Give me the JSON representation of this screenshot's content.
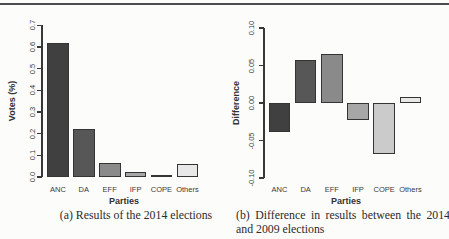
{
  "palette": {
    "bar_colors": [
      "#404040",
      "#575757",
      "#8a8a8a",
      "#a7a7a7",
      "#cbcbcb",
      "#e8e8e8"
    ],
    "bar_border": "#343434",
    "axis_color": "#383838",
    "text_color": "#3a3a3a",
    "rule_color": "#4c4c4c",
    "background": "#fcfcfb"
  },
  "captions": {
    "a": "(a) Results of the 2014 elections",
    "b": "(b) Difference in results between the 2014 and 2009 elections"
  },
  "chart_data": [
    {
      "type": "bar",
      "title": "",
      "categories": [
        "ANC",
        "DA",
        "EFF",
        "IFP",
        "COPE",
        "Others"
      ],
      "values": [
        0.62,
        0.22,
        0.065,
        0.024,
        0.007,
        0.062
      ],
      "xlabel": "Parties",
      "ylabel": "Votes (%)",
      "ylim": [
        0.0,
        0.7
      ],
      "yticks": [
        0.0,
        0.1,
        0.2,
        0.3,
        0.4,
        0.5,
        0.6,
        0.7
      ],
      "ytick_labels": [
        "0.0",
        "0.1",
        "0.2",
        "0.3",
        "0.4",
        "0.5",
        "0.6",
        "0.7"
      ],
      "grid": false,
      "legend": false
    },
    {
      "type": "bar",
      "title": "",
      "categories": [
        "ANC",
        "DA",
        "EFF",
        "IFP",
        "COPE",
        "Others"
      ],
      "values": [
        -0.038,
        0.057,
        0.065,
        -0.022,
        -0.068,
        0.008
      ],
      "xlabel": "Parties",
      "ylabel": "Difference",
      "ylim": [
        -0.1,
        0.1
      ],
      "yticks": [
        -0.1,
        -0.05,
        0.0,
        0.05,
        0.1
      ],
      "ytick_labels": [
        "-0.10",
        "-0.05",
        "0.00",
        "0.05",
        "0.10"
      ],
      "grid": false,
      "legend": false
    }
  ]
}
